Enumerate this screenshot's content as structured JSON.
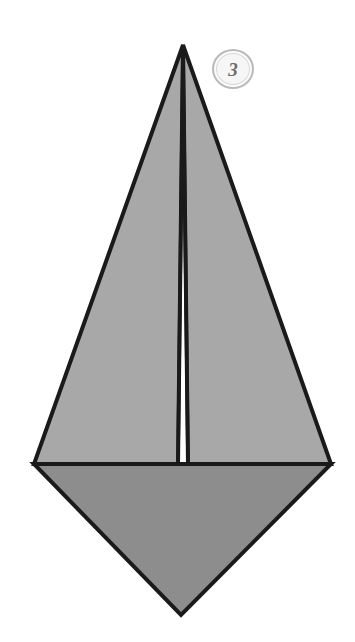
{
  "diagram": {
    "type": "origami-instruction-step",
    "background_color": "#ffffff",
    "canvas": {
      "width": 355,
      "height": 642
    },
    "step_badge": {
      "number": "3",
      "shape": "circle",
      "ring_color": "#b9b9b9",
      "fill_color": "#fbfbfb",
      "text_color": "#6d6d6d",
      "center": {
        "x": 233,
        "y": 69
      },
      "radius": 21
    },
    "colors": {
      "outline": "#1a1a1a",
      "upper_flap_fill": "#a8a8a8",
      "lower_diamond_fill": "#8d8d8d",
      "paper_white": "#ffffff"
    },
    "vertices": {
      "apex": {
        "x": 183,
        "y": 45
      },
      "left": {
        "x": 34,
        "y": 464
      },
      "right": {
        "x": 331,
        "y": 464
      },
      "bottom": {
        "x": 181,
        "y": 615
      },
      "center_base_left": {
        "x": 178,
        "y": 464
      },
      "center_base_right": {
        "x": 188,
        "y": 464
      }
    },
    "shapes": [
      {
        "name": "lower-diamond",
        "label": "Lower diamond region",
        "fill": "#8d8d8d",
        "points": "34,464 331,464 181,615"
      },
      {
        "name": "left-flap",
        "label": "Left triangular flap",
        "fill": "#a8a8a8",
        "points": "183,45 34,464 178,464"
      },
      {
        "name": "right-flap",
        "label": "Right triangular flap",
        "fill": "#a8a8a8",
        "points": "183,45 188,464 331,464"
      }
    ],
    "creases": [
      {
        "name": "center-crease-left",
        "label": "Left center crease line",
        "from": {
          "x": 183,
          "y": 45
        },
        "to": {
          "x": 178,
          "y": 464
        }
      },
      {
        "name": "center-crease-right",
        "label": "Right center crease line",
        "from": {
          "x": 183,
          "y": 45
        },
        "to": {
          "x": 188,
          "y": 464
        }
      },
      {
        "name": "horizontal-fold",
        "label": "Horizontal fold line",
        "from": {
          "x": 34,
          "y": 464
        },
        "to": {
          "x": 331,
          "y": 464
        }
      }
    ]
  }
}
